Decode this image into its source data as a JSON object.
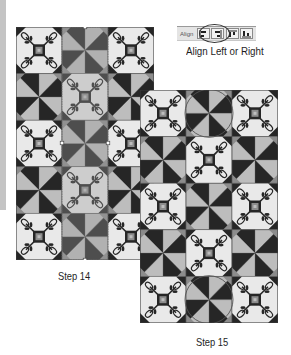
{
  "figure": {
    "toolbar": {
      "label": "Align",
      "buttons": [
        {
          "icon": "align-left-icon",
          "tooltip": "Align Left"
        },
        {
          "icon": "align-right-icon",
          "tooltip": "Align Right"
        },
        {
          "icon": "align-top-icon",
          "tooltip": "Align Top"
        },
        {
          "icon": "align-bottom-icon",
          "tooltip": "Align Bottom"
        }
      ],
      "highlighted": [
        "align-left-icon",
        "align-right-icon"
      ]
    },
    "toolbar_caption": "Align Left or Right",
    "step14": {
      "caption": "Step 14",
      "grid": [
        [
          "applique",
          "pinwheel",
          "applique"
        ],
        [
          "pinwheel",
          "applique",
          "pinwheel"
        ],
        [
          "applique",
          "pinwheel",
          "applique"
        ],
        [
          "pinwheel",
          "applique",
          "pinwheel"
        ],
        [
          "applique",
          "pinwheel",
          "applique"
        ]
      ],
      "selected_column": 1
    },
    "step15": {
      "caption": "Step 15",
      "grid": [
        [
          "applique",
          "pinwheel",
          "applique"
        ],
        [
          "pinwheel",
          "applique",
          "pinwheel"
        ],
        [
          "applique",
          "pinwheel",
          "applique"
        ],
        [
          "pinwheel",
          "applique",
          "pinwheel"
        ],
        [
          "applique",
          "pinwheel",
          "applique"
        ]
      ],
      "circled_blocks": [
        [
          0,
          1
        ],
        [
          4,
          1
        ]
      ]
    },
    "colors": {
      "dark": "#262626",
      "light": "#bdbdbd",
      "medium": "#8c8c8c",
      "background_light": "#e9e9e9",
      "selection_tint": "#9a9a9a"
    }
  }
}
